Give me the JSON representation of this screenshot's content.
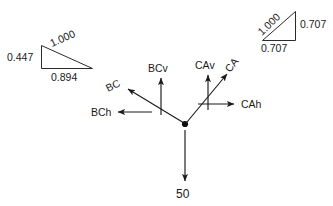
{
  "diagram": {
    "origin_label": "origin-point",
    "applied_force": {
      "label": "50",
      "direction": "down"
    },
    "vectors": [
      {
        "name": "BC",
        "label": "BC",
        "kind": "resultant",
        "direction": "up-left"
      },
      {
        "name": "BCh",
        "label": "BCh",
        "kind": "horizontal",
        "direction": "left"
      },
      {
        "name": "BCv",
        "label": "BCv",
        "kind": "vertical",
        "direction": "up"
      },
      {
        "name": "CA",
        "label": "CA",
        "kind": "resultant",
        "direction": "up-right"
      },
      {
        "name": "CAh",
        "label": "CAh",
        "kind": "horizontal",
        "direction": "right"
      },
      {
        "name": "CAv",
        "label": "CAv",
        "kind": "vertical",
        "direction": "up"
      }
    ],
    "triangles": [
      {
        "name": "bc-slope-triangle",
        "position": "top-left",
        "vertical_label": "0.447",
        "hypotenuse_label": "1.000",
        "horizontal_label": "0.894"
      },
      {
        "name": "ca-slope-triangle",
        "position": "top-right",
        "hypotenuse_label": "1.000",
        "vertical_label": "0.707",
        "horizontal_label": "0.707"
      }
    ],
    "colors": {
      "ink": "#1a1a1a",
      "line": "#2b2b2b",
      "background": "#ffffff"
    }
  }
}
